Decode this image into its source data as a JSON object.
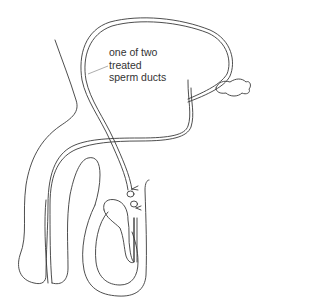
{
  "diagram": {
    "label": {
      "lines": [
        "one of two",
        "treated",
        "sperm ducts"
      ]
    },
    "colors": {
      "line": "#3a3a3a",
      "leader": "#8a8a8a",
      "background": "#ffffff"
    }
  }
}
